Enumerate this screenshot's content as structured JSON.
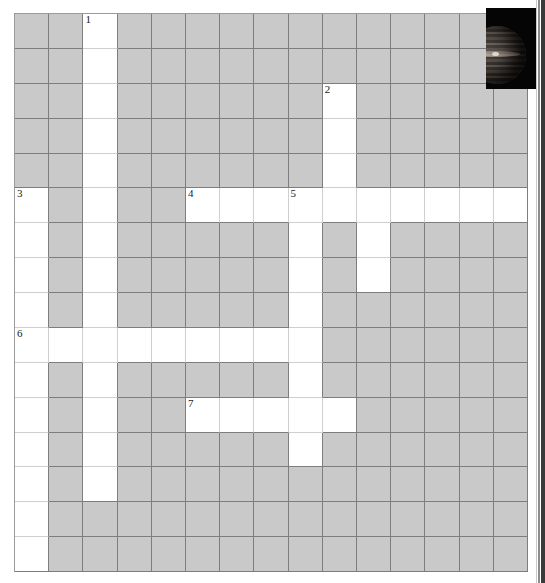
{
  "puzzle": {
    "title": "Crossword grid",
    "columns": 15,
    "rows": 16,
    "colors": {
      "block": "#c9c9c9",
      "open": "#ffffff",
      "grid_line": "#7d7d7d",
      "light_grid_line": "#cfcfcf",
      "number_text": "#1a1a1a"
    },
    "clue_numbers": [
      {
        "label": "1",
        "row": 0,
        "col": 2
      },
      {
        "label": "2",
        "row": 2,
        "col": 9
      },
      {
        "label": "3",
        "row": 5,
        "col": 0
      },
      {
        "label": "4",
        "row": 5,
        "col": 5
      },
      {
        "label": "5",
        "row": 5,
        "col": 8
      },
      {
        "label": "6",
        "row": 9,
        "col": 0
      },
      {
        "label": "7",
        "row": 11,
        "col": 5
      }
    ],
    "open_cells": [
      [
        0,
        2
      ],
      [
        1,
        2
      ],
      [
        2,
        2
      ],
      [
        2,
        9
      ],
      [
        3,
        2
      ],
      [
        3,
        9
      ],
      [
        4,
        2
      ],
      [
        4,
        9
      ],
      [
        5,
        0
      ],
      [
        5,
        2
      ],
      [
        5,
        5
      ],
      [
        5,
        6
      ],
      [
        5,
        7
      ],
      [
        5,
        8
      ],
      [
        5,
        9
      ],
      [
        5,
        10
      ],
      [
        5,
        11
      ],
      [
        5,
        12
      ],
      [
        5,
        13
      ],
      [
        5,
        14
      ],
      [
        6,
        0
      ],
      [
        6,
        2
      ],
      [
        6,
        8
      ],
      [
        6,
        10
      ],
      [
        7,
        0
      ],
      [
        7,
        2
      ],
      [
        7,
        8
      ],
      [
        7,
        10
      ],
      [
        8,
        0
      ],
      [
        8,
        2
      ],
      [
        8,
        8
      ],
      [
        9,
        0
      ],
      [
        9,
        1
      ],
      [
        9,
        2
      ],
      [
        9,
        3
      ],
      [
        9,
        4
      ],
      [
        9,
        5
      ],
      [
        9,
        6
      ],
      [
        9,
        7
      ],
      [
        9,
        8
      ],
      [
        10,
        0
      ],
      [
        10,
        2
      ],
      [
        10,
        8
      ],
      [
        11,
        0
      ],
      [
        11,
        2
      ],
      [
        11,
        5
      ],
      [
        11,
        6
      ],
      [
        11,
        7
      ],
      [
        11,
        8
      ],
      [
        11,
        9
      ],
      [
        12,
        0
      ],
      [
        12,
        2
      ],
      [
        12,
        8
      ],
      [
        13,
        0
      ],
      [
        13,
        2
      ],
      [
        14,
        0
      ],
      [
        15,
        0
      ]
    ]
  },
  "photo": {
    "name": "jupiter-photo",
    "alt_text": "Jupiter",
    "background_color": "#050505"
  }
}
